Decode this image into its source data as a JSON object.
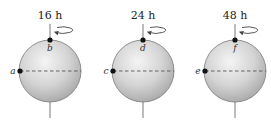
{
  "diagram": {
    "colors": {
      "sphere_light": "#f2f2f2",
      "sphere_dark": "#a8a8a8",
      "outline": "#777777",
      "axis": "#555555",
      "dashed_equator": "#555555",
      "point": "#111111"
    },
    "spheres": [
      {
        "period_label": "16 h",
        "top_point": "b",
        "equator_point": "a",
        "cx": 50
      },
      {
        "period_label": "24 h",
        "top_point": "d",
        "equator_point": "c",
        "cx": 143
      },
      {
        "period_label": "48 h",
        "top_point": "f",
        "equator_point": "e",
        "cx": 235
      }
    ]
  }
}
